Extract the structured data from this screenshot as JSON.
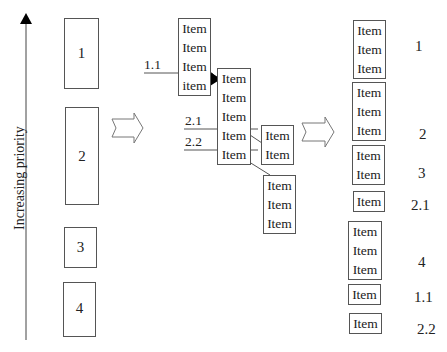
{
  "axis": {
    "label": "Increasing priority"
  },
  "left_blocks": [
    {
      "label": "1"
    },
    {
      "label": "2"
    },
    {
      "label": "3"
    },
    {
      "label": "4"
    }
  ],
  "middle": {
    "stack_a": [
      "Item",
      "Item",
      "Item",
      "item"
    ],
    "stack_b": [
      "Item",
      "Item",
      "Item",
      "Item",
      "Item"
    ],
    "stack_c": [
      "Item",
      "Item"
    ],
    "stack_d": [
      "Item",
      "Item",
      "Item"
    ],
    "labels": {
      "l11": "1.1",
      "l21": "2.1",
      "l22": "2.2"
    }
  },
  "right": {
    "groups": [
      {
        "items": [
          "Item",
          "Item",
          "Item"
        ],
        "label": "1"
      },
      {
        "items": [
          "Item",
          "Item",
          "Item"
        ],
        "label": "2"
      },
      {
        "items": [
          "Item",
          "Item"
        ],
        "label": "3"
      },
      {
        "items": [
          "Item"
        ],
        "label": "2.1"
      },
      {
        "items": [
          "Item",
          "Item",
          "Item"
        ],
        "label": "4"
      },
      {
        "items": [
          "Item"
        ],
        "label": "1.1"
      },
      {
        "items": [
          "Item"
        ],
        "label": "2.2"
      }
    ]
  }
}
